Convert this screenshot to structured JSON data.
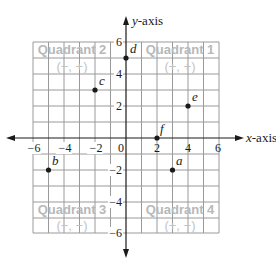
{
  "diagram": {
    "type": "coordinate-plane",
    "axes": {
      "x_title_var": "x",
      "x_title_rest": "-axis",
      "y_title_var": "y",
      "y_title_rest": "-axis",
      "origin_label": "0",
      "range": [
        -6,
        6
      ],
      "grid_step": 1
    },
    "x_ticks": [
      {
        "value": -6,
        "label": "−6"
      },
      {
        "value": -4,
        "label": "−4"
      },
      {
        "value": -2,
        "label": "−2"
      },
      {
        "value": 2,
        "label": "2"
      },
      {
        "value": 4,
        "label": "4"
      },
      {
        "value": 6,
        "label": "6"
      }
    ],
    "y_ticks": [
      {
        "value": 6,
        "label": "6"
      },
      {
        "value": 4,
        "label": "4"
      },
      {
        "value": 2,
        "label": "2"
      },
      {
        "value": -2,
        "label": "−2"
      },
      {
        "value": -4,
        "label": "−4"
      },
      {
        "value": -6,
        "label": "−6"
      }
    ],
    "quadrants": [
      {
        "name": "Quadrant 2",
        "signs": "(−, +)"
      },
      {
        "name": "Quadrant 1",
        "signs": "(+, +)"
      },
      {
        "name": "Quadrant 3",
        "signs": "(−, −)"
      },
      {
        "name": "Quadrant 4",
        "signs": "(+, −)"
      }
    ],
    "points": [
      {
        "label": "a",
        "x": 3,
        "y": -2
      },
      {
        "label": "b",
        "x": -5,
        "y": -2
      },
      {
        "label": "c",
        "x": -2,
        "y": 3
      },
      {
        "label": "d",
        "x": 0,
        "y": 5
      },
      {
        "label": "e",
        "x": 4,
        "y": 2
      },
      {
        "label": "f",
        "x": 2,
        "y": 0
      }
    ],
    "colors": {
      "grid": "#9a9a9a",
      "axis": "#1a1a1a",
      "quadrant_text": "#b8b8b8",
      "point": "#1a1a1a"
    }
  }
}
